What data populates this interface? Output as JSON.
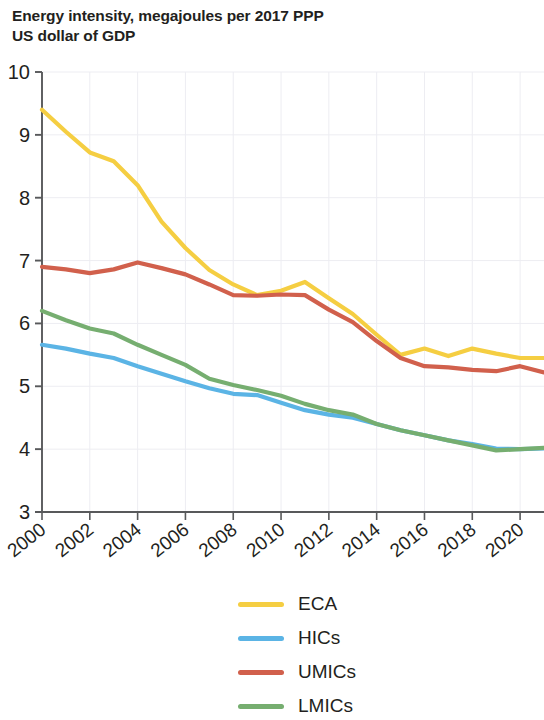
{
  "chart_data": {
    "type": "line",
    "title": "Energy intensity, megajoules per 2017 PPP\nUS dollar of GDP",
    "xlabel": "",
    "ylabel": "",
    "xlim": [
      2000,
      2021
    ],
    "ylim": [
      3,
      10
    ],
    "y_ticks": [
      3,
      4,
      5,
      6,
      7,
      8,
      9,
      10
    ],
    "y_tick_labels": [
      "3",
      "4",
      "5",
      "6",
      "7",
      "8",
      "9",
      "10"
    ],
    "x_ticks": [
      2000,
      2002,
      2004,
      2006,
      2008,
      2010,
      2012,
      2014,
      2016,
      2018,
      2020
    ],
    "x_tick_labels": [
      "2000",
      "2002",
      "2004",
      "2006",
      "2008",
      "2010",
      "2012",
      "2014",
      "2016",
      "2018",
      "2020"
    ],
    "grid": true,
    "legend_position": "bottom",
    "x": [
      2000,
      2001,
      2002,
      2003,
      2004,
      2005,
      2006,
      2007,
      2008,
      2009,
      2010,
      2011,
      2012,
      2013,
      2014,
      2015,
      2016,
      2017,
      2018,
      2019,
      2020,
      2021
    ],
    "series": [
      {
        "name": "ECA",
        "color": "#f5ce42",
        "values": [
          9.4,
          9.05,
          8.72,
          8.58,
          8.2,
          7.62,
          7.2,
          6.85,
          6.62,
          6.45,
          6.52,
          6.66,
          6.4,
          6.15,
          5.82,
          5.5,
          5.6,
          5.48,
          5.6,
          5.52,
          5.45,
          5.45
        ]
      },
      {
        "name": "HICs",
        "color": "#5bb4e5",
        "values": [
          5.66,
          5.6,
          5.52,
          5.45,
          5.32,
          5.2,
          5.08,
          4.97,
          4.88,
          4.86,
          4.74,
          4.62,
          4.55,
          4.5,
          4.4,
          4.3,
          4.22,
          4.14,
          4.08,
          4.01,
          4.0,
          4.01
        ]
      },
      {
        "name": "UMICs",
        "color": "#d1604c",
        "values": [
          6.9,
          6.86,
          6.8,
          6.86,
          6.97,
          6.88,
          6.78,
          6.62,
          6.45,
          6.44,
          6.46,
          6.45,
          6.22,
          6.02,
          5.72,
          5.45,
          5.32,
          5.3,
          5.26,
          5.24,
          5.32,
          5.22
        ]
      },
      {
        "name": "LMICs",
        "color": "#76ae70",
        "values": [
          6.2,
          6.05,
          5.92,
          5.84,
          5.66,
          5.5,
          5.34,
          5.12,
          5.02,
          4.94,
          4.85,
          4.72,
          4.62,
          4.55,
          4.4,
          4.3,
          4.22,
          4.14,
          4.06,
          3.98,
          4.0,
          4.02
        ]
      }
    ]
  },
  "legend": {
    "items": [
      {
        "label": "ECA",
        "color": "#f5ce42"
      },
      {
        "label": "HICs",
        "color": "#5bb4e5"
      },
      {
        "label": "UMICs",
        "color": "#d1604c"
      },
      {
        "label": "LMICs",
        "color": "#76ae70"
      }
    ]
  },
  "axis_style": {
    "axis_color": "#58595b",
    "grid_color": "#ededf2",
    "tick_label_color": "#231f20"
  }
}
